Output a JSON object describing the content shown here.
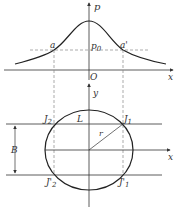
{
  "top_plot": {
    "vertical_axis_label": "p",
    "horizontal_axis_label": "x",
    "origin_label": "O",
    "level_label": "p",
    "level_label_sub": "0",
    "left_point_label": "a",
    "right_point_label": "a'"
  },
  "bottom_plot": {
    "vertical_axis_label": "y",
    "horizontal_axis_label": "x",
    "top_left_point": {
      "main": "J",
      "sub": "2"
    },
    "top_right_point": {
      "main": "J",
      "sub": "1"
    },
    "bottom_left_point": {
      "main": "J'",
      "sub": "2"
    },
    "bottom_right_point": {
      "main": "J'",
      "sub": "1"
    },
    "chord_label": "L",
    "radius_label": "r",
    "width_label": "B"
  },
  "colors": {
    "stroke": "#333333",
    "curve": "#222222",
    "dashed": "#888888",
    "background": "#ffffff"
  }
}
